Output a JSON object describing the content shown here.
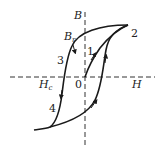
{
  "diagram": {
    "axes": {
      "x_label": "H",
      "y_label": "B",
      "origin_label": "0"
    },
    "labels": {
      "remanence": "B",
      "remanence_sub": "r",
      "coercivity": "H",
      "coercivity_sub": "c",
      "point_1": "1",
      "point_2": "2",
      "point_3": "3",
      "point_4": "4"
    },
    "colors": {
      "curve": "#1a1a1a",
      "axis": "#333333",
      "background": "#ffffff"
    }
  }
}
